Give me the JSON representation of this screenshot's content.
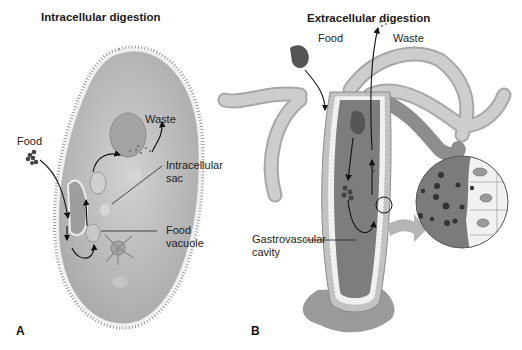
{
  "figure": {
    "panel_a": {
      "letter": "A",
      "title": "Intracellular digestion",
      "labels": {
        "food": "Food",
        "waste": "Waste",
        "intracellular_sac_line1": "Intracellular",
        "intracellular_sac_line2": "sac",
        "food_vacuole_line1": "Food",
        "food_vacuole_line2": "vacuole"
      }
    },
    "panel_b": {
      "letter": "B",
      "title": "Extracellular digestion",
      "labels": {
        "food": "Food",
        "waste": "Waste",
        "gastrovascular_line1": "Gastrovascular",
        "gastrovascular_line2": "cavity"
      }
    },
    "colors": {
      "cell_fill": "#b9b9b9",
      "cell_edge": "#8a8a8a",
      "cavity_fill": "#7b7b7b",
      "tentacle_fill": "#c4c4c4",
      "food_fill": "#5a5a5a",
      "arrow": "#111111"
    }
  }
}
